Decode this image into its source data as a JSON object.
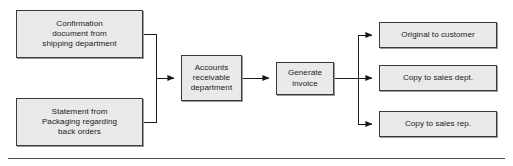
{
  "diagram": {
    "type": "flowchart",
    "orientation": "left-to-right",
    "colors": {
      "node_fill": "#e9e9e9",
      "node_border": "#3a3a3a",
      "connector": "#1a1a1a",
      "text": "#1a1a1a",
      "rule": "#4a4a4a",
      "background": "#ffffff"
    },
    "inputs": [
      {
        "id": "confirmation-document",
        "label": "Confirmation\ndocument from\nshipping department",
        "x": 16,
        "y": 10,
        "width": 127,
        "height": 48
      },
      {
        "id": "packaging-statement",
        "label": "Statement from\nPackaging regarding\nback orders",
        "x": 16,
        "y": 98,
        "width": 127,
        "height": 48
      }
    ],
    "process": [
      {
        "id": "accounts-receivable-department",
        "label": "Accounts\nreceivable\ndepartment",
        "x": 181,
        "y": 55,
        "width": 61,
        "height": 46
      },
      {
        "id": "generate-invoice",
        "label": "Generate\ninvoice",
        "x": 276,
        "y": 62,
        "width": 58,
        "height": 33
      }
    ],
    "outputs": [
      {
        "id": "original-to-customer",
        "label": "Original to customer",
        "x": 379,
        "y": 22,
        "width": 118,
        "height": 26
      },
      {
        "id": "copy-to-sales-dept",
        "label": "Copy to sales dept.",
        "x": 379,
        "y": 65,
        "width": 118,
        "height": 26
      },
      {
        "id": "copy-to-sales-rep",
        "label": "Copy to sales rep.",
        "x": 379,
        "y": 111,
        "width": 118,
        "height": 26
      }
    ],
    "connectors": {
      "merge_bus_x": 156,
      "branch_bus_x": 358,
      "main_axis_y": 78,
      "input_top_y": 34,
      "input_bottom_y": 122,
      "output_top_y": 35,
      "output_middle_y": 78,
      "output_bottom_y": 124
    },
    "footer_rule": {
      "x": 8,
      "y": 158,
      "width": 497,
      "height": 1
    }
  }
}
